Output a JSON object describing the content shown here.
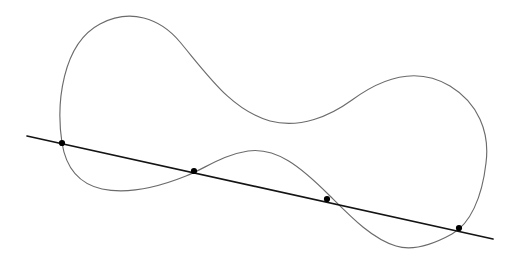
{
  "figure": {
    "background_color": "#ffffff",
    "width": 513,
    "height": 262,
    "curve": {
      "name": "closed-curve",
      "description": "smooth closed dumbbell / figure-eight-like loop",
      "stroke_color": "#6b6b6b",
      "stroke_width": 1.15,
      "closed": true,
      "path": "M 62,143 C 56,104 62,44 100,24 C 130,8 160,18 180,42 C 210,78 232,110 270,121 C 300,129 330,116 352,100 C 386,75 420,68 450,86 C 478,103 490,132 486,163 C 482,198 470,224 452,234 C 432,245 412,251 396,246 C 372,239 350,216 330,196 C 300,166 276,147 248,151 C 222,155 206,168 186,176 C 156,188 126,194 102,189 C 80,184 66,168 62,143 Z",
      "extrema": {
        "left_lobe_top": [
          122,
          19
        ],
        "left_lobe_bottom": [
          100,
          189
        ],
        "leftmost": [
          57,
          120
        ],
        "middle_upper_saddle": [
          280,
          121
        ],
        "middle_lower_peak": [
          248,
          151
        ],
        "right_lobe_top": [
          410,
          83
        ],
        "right_lobe_bottom": [
          403,
          250
        ],
        "rightmost": [
          486,
          152
        ]
      }
    },
    "line": {
      "name": "secant-line",
      "description": "straight line crossing the closed curve at four points",
      "stroke_color": "#141414",
      "stroke_width": 1.7,
      "start": [
        27,
        136
      ],
      "end": [
        493,
        239
      ]
    },
    "intersection_points": [
      {
        "label": "P1",
        "x": 62,
        "y": 143,
        "radius": 3.1
      },
      {
        "label": "P2",
        "x": 194,
        "y": 171,
        "radius": 3.1
      },
      {
        "label": "P3",
        "x": 327,
        "y": 199,
        "radius": 3.1
      },
      {
        "label": "P4",
        "x": 459,
        "y": 228,
        "radius": 3.1
      }
    ]
  }
}
